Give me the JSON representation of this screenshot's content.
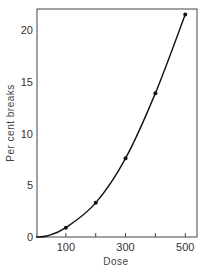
{
  "chart_data": {
    "type": "line",
    "title": "",
    "xlabel": "Dose",
    "ylabel": "Per cent breaks",
    "x": [
      100,
      200,
      300,
      400,
      500
    ],
    "values": [
      0.9,
      3.3,
      7.6,
      13.9,
      21.5
    ],
    "series": [
      {
        "name": "Per cent breaks",
        "x": [
          100,
          200,
          300,
          400,
          500
        ],
        "values": [
          0.9,
          3.3,
          7.6,
          13.9,
          21.5
        ],
        "markers": true,
        "smooth_curve_from_origin": true
      }
    ],
    "xlim": [
      0,
      530
    ],
    "ylim": [
      0,
      22
    ],
    "xticks": [
      100,
      200,
      300,
      400,
      500
    ],
    "xtick_labels": [
      "100",
      "",
      "300",
      "",
      "500"
    ],
    "yticks": [
      0,
      5,
      10,
      15,
      20
    ],
    "ytick_labels": [
      "0",
      "5",
      "10",
      "15",
      "20"
    ],
    "grid": false,
    "legend": null,
    "frame": "box"
  }
}
